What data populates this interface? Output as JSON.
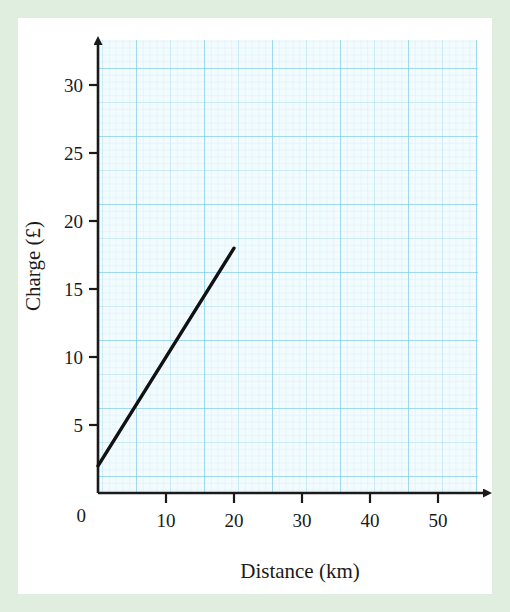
{
  "page": {
    "border_color": "#dfeedf",
    "paper_color": "#ffffff"
  },
  "chart_data": {
    "type": "line",
    "title": "",
    "xlabel": "Distance (km)",
    "ylabel": "Charge (£)",
    "xlim": [
      0,
      55
    ],
    "ylim": [
      0,
      32
    ],
    "xticks": [
      0,
      10,
      20,
      30,
      40,
      50
    ],
    "yticks": [
      0,
      5,
      10,
      15,
      20,
      25,
      30
    ],
    "xtick_labels": [
      "0",
      "10",
      "20",
      "30",
      "40",
      "50"
    ],
    "ytick_labels": [
      "0",
      "5",
      "10",
      "15",
      "20",
      "25",
      "30"
    ],
    "grid": true,
    "grid_style": "graph-paper-millimetre",
    "grid_colors": {
      "minor": "#bfe4f2",
      "medium": "#9fd8ee",
      "major": "#74c6e6",
      "background": "#f2fbfe"
    },
    "axis_arrows": true,
    "legend": false,
    "series": [
      {
        "name": "Charge",
        "color": "#111111",
        "x": [
          0,
          20
        ],
        "y": [
          2,
          18
        ],
        "intercept": 2,
        "slope": 0.8
      }
    ]
  },
  "labels": {
    "y_axis_title": "Charge (£)",
    "x_axis_title": "Distance (km)",
    "y_0": "0",
    "y_5": "5",
    "y_10": "10",
    "y_15": "15",
    "y_20": "20",
    "y_25": "25",
    "y_30": "30",
    "x_0": "0",
    "x_10": "10",
    "x_20": "20",
    "x_30": "30",
    "x_40": "40",
    "x_50": "50"
  }
}
